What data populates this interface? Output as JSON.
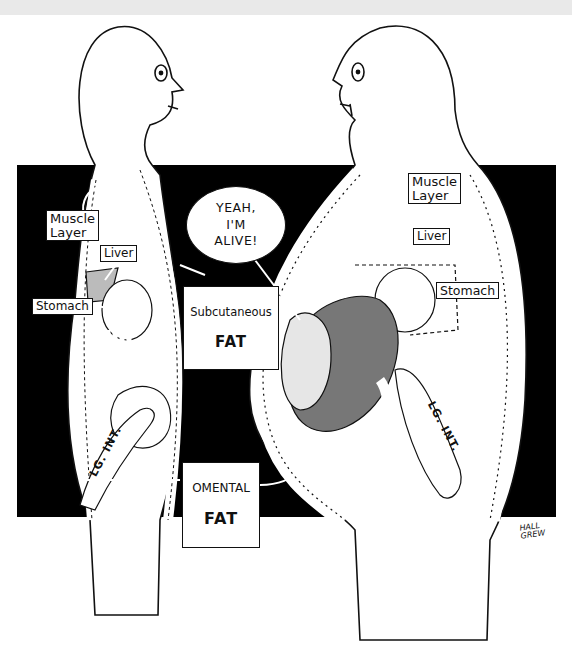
{
  "figure": {
    "colors": {
      "panel_background": "#000000",
      "figure_fill": "#ffffff",
      "top_band": "#e9e9e9"
    }
  },
  "left_figure": {
    "labels": {
      "muscle_layer": "Muscle\nLayer",
      "liver": "Liver",
      "stomach": "Stomach",
      "large_intestine": "LG. INT."
    }
  },
  "right_figure": {
    "labels": {
      "muscle_layer": "Muscle\nLayer",
      "liver": "Liver",
      "stomach": "Stomach",
      "large_intestine": "LG. INT."
    }
  },
  "shared_labels": {
    "subcutaneous_fat": {
      "line1": "Subcutaneous",
      "line2": "FAT"
    },
    "omental_fat": {
      "line1": "OMENTAL",
      "line2": "FAT"
    }
  },
  "speech_bubble": {
    "text": "YEAH,\nI'M\nALIVE!"
  },
  "signature": {
    "text": "HALL\nGREW"
  }
}
